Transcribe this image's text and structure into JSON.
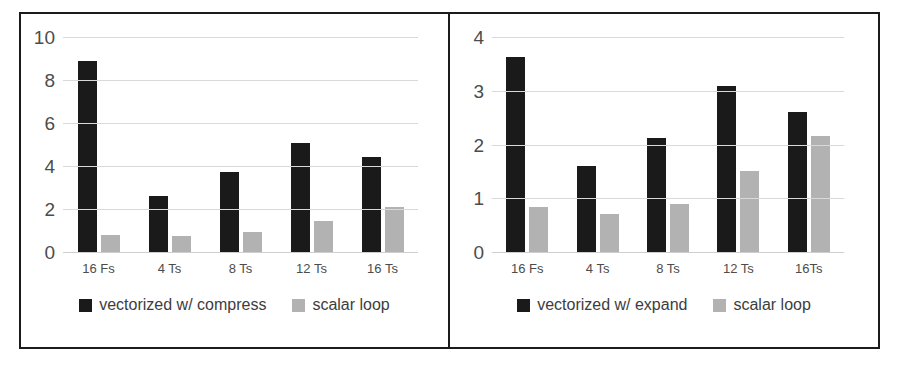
{
  "figure": {
    "background_color": "#ffffff",
    "border_color": "#1b1b1b",
    "series_colors": {
      "vectorized": "#1a1a1a",
      "scalar": "#b2b2b2"
    }
  },
  "chart_data": [
    {
      "type": "bar",
      "panel": "left",
      "title": "",
      "xlabel": "",
      "ylabel": "",
      "ylim": [
        0,
        10
      ],
      "yticks": [
        0,
        2,
        4,
        6,
        8,
        10
      ],
      "ytick_labels": [
        "0",
        "2",
        "4",
        "6",
        "8",
        "10"
      ],
      "grid": true,
      "legend_position": "bottom",
      "categories": [
        "16 Fs",
        "4 Ts",
        "8 Ts",
        "12 Ts",
        "16 Ts"
      ],
      "series": [
        {
          "name": "vectorized w/ compress",
          "color": "#1a1a1a",
          "values": [
            8.9,
            2.6,
            3.7,
            5.05,
            4.4
          ]
        },
        {
          "name": "scalar loop",
          "color": "#b2b2b2",
          "values": [
            0.8,
            0.75,
            0.95,
            1.45,
            2.1
          ]
        }
      ]
    },
    {
      "type": "bar",
      "panel": "right",
      "title": "",
      "xlabel": "",
      "ylabel": "",
      "ylim": [
        0,
        4
      ],
      "yticks": [
        0,
        1,
        2,
        3,
        4
      ],
      "ytick_labels": [
        "0",
        "1",
        "2",
        "3",
        "4"
      ],
      "grid": true,
      "legend_position": "bottom",
      "categories": [
        "16 Fs",
        "4 Ts",
        "8 Ts",
        "12 Ts",
        "16Ts"
      ],
      "series": [
        {
          "name": "vectorized w/ expand",
          "color": "#1a1a1a",
          "values": [
            3.62,
            1.6,
            2.12,
            3.08,
            2.6
          ]
        },
        {
          "name": "scalar loop",
          "color": "#b2b2b2",
          "values": [
            0.83,
            0.7,
            0.9,
            1.5,
            2.15
          ]
        }
      ]
    }
  ],
  "left_chart": {
    "ytick_labels": [
      "10",
      "8",
      "6",
      "4",
      "2",
      "0"
    ],
    "xtick_labels": [
      "16 Fs",
      "4 Ts",
      "8 Ts",
      "12 Ts",
      "16 Ts"
    ],
    "legend": [
      {
        "label": "vectorized w/ compress",
        "swatch": "black-square-swatch"
      },
      {
        "label": "scalar loop",
        "swatch": "gray-square-swatch"
      }
    ]
  },
  "right_chart": {
    "ytick_labels": [
      "4",
      "3",
      "2",
      "1",
      "0"
    ],
    "xtick_labels": [
      "16 Fs",
      "4 Ts",
      "8 Ts",
      "12 Ts",
      "16Ts"
    ],
    "legend": [
      {
        "label": "vectorized w/ expand",
        "swatch": "black-square-swatch"
      },
      {
        "label": "scalar loop",
        "swatch": "gray-square-swatch"
      }
    ]
  }
}
